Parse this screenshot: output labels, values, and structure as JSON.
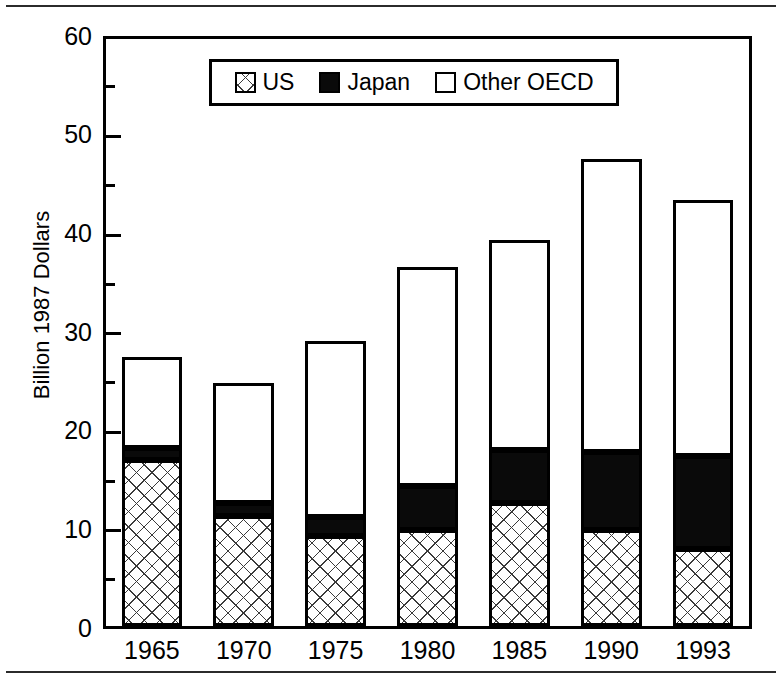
{
  "chart_data": {
    "type": "bar",
    "subtype": "stacked-vertical",
    "title": "",
    "subtitle": "",
    "xlabel": "",
    "ylabel": "Billion 1987 Dollars",
    "ylim": [
      0,
      60
    ],
    "ytick_labels": [
      "0",
      "10",
      "20",
      "30",
      "40",
      "50",
      "60"
    ],
    "ytick_values": [
      0,
      10,
      20,
      30,
      40,
      50,
      60
    ],
    "yminor_tick_values": [
      5,
      15,
      25,
      35,
      45,
      55
    ],
    "grid": false,
    "categories": [
      "1965",
      "1970",
      "1975",
      "1980",
      "1985",
      "1990",
      "1993"
    ],
    "series": [
      {
        "name": "US",
        "pattern": "crosshatch",
        "color": "#ffffff",
        "values": [
          17.0,
          11.2,
          9.2,
          9.8,
          12.6,
          9.8,
          7.9
        ]
      },
      {
        "name": "Japan",
        "pattern": "solid",
        "color": "#0a0a0a",
        "values": [
          1.2,
          1.4,
          1.9,
          4.5,
          5.4,
          8.0,
          9.5
        ]
      },
      {
        "name": "Other OECD",
        "pattern": "empty",
        "color": "#ffffff",
        "values": [
          9.3,
          12.2,
          18.0,
          22.4,
          21.5,
          29.9,
          26.1
        ]
      }
    ],
    "totals": [
      27.5,
      24.8,
      29.1,
      36.7,
      39.5,
      47.7,
      43.5
    ],
    "legend_position": "top-center",
    "legend_entries": [
      "US",
      "Japan",
      "Other OECD"
    ]
  },
  "legend": {
    "items": [
      {
        "label": "US",
        "swatch": "crosshatch-swatch"
      },
      {
        "label": "Japan",
        "swatch": "solid-black-swatch"
      },
      {
        "label": "Other OECD",
        "swatch": "empty-white-swatch"
      }
    ]
  },
  "axes": {
    "y_title": "Billion 1987 Dollars",
    "y_labels": [
      "60",
      "50",
      "40",
      "30",
      "20",
      "10",
      "0"
    ],
    "x_labels": [
      "1965",
      "1970",
      "1975",
      "1980",
      "1985",
      "1990",
      "1993"
    ]
  },
  "colors": {
    "ink": "#000000",
    "japan_fill": "#0a0a0a",
    "us_hatch": "#3a3a3a",
    "background": "#ffffff"
  }
}
